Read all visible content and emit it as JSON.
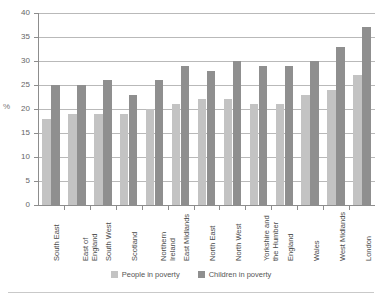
{
  "chart_data": {
    "type": "bar",
    "title": "",
    "xlabel": "",
    "ylabel": "%",
    "ylim": [
      0,
      40
    ],
    "ytick_step": 5,
    "yticks": [
      0,
      5,
      10,
      15,
      20,
      25,
      30,
      35,
      40
    ],
    "grid": true,
    "legend_position": "bottom",
    "categories": [
      "South East",
      "East of\nEngland",
      "South West",
      "Scotland",
      "Northern\nIreland",
      "East Midlands",
      "North East",
      "North West",
      "Yorkshire and\nthe Humber",
      "England",
      "Wales",
      "West Midlands",
      "London"
    ],
    "series": [
      {
        "name": "People in poverty",
        "color": "#c3c3c3",
        "values": [
          18,
          19,
          19,
          19,
          20,
          21,
          22,
          22,
          21,
          21,
          23,
          24,
          27
        ]
      },
      {
        "name": "Children in poverty",
        "color": "#8f8f8f",
        "values": [
          25,
          25,
          26,
          23,
          26,
          29,
          28,
          30,
          29,
          29,
          30,
          33,
          37
        ]
      }
    ]
  },
  "legend": {
    "items": [
      {
        "label": "People in poverty"
      },
      {
        "label": "Children in poverty"
      }
    ]
  }
}
